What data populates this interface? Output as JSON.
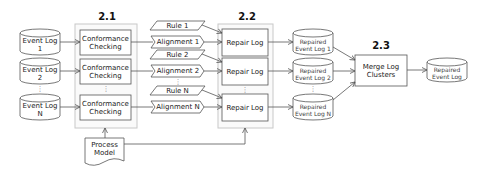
{
  "diagram": {
    "sections": {
      "conformance": "2.1",
      "repair": "2.2",
      "merge": "2.3"
    },
    "inputs": [
      {
        "label": "Event Log 1"
      },
      {
        "label": "Event Log 2"
      },
      {
        "label": "Event Log N"
      }
    ],
    "conformance_steps": [
      {
        "label": "Conformance\nChecking"
      },
      {
        "label": "Conformance\nChecking"
      },
      {
        "label": "Conformance\nChecking"
      }
    ],
    "rules": [
      {
        "label": "Rule 1"
      },
      {
        "label": "Rule 2"
      },
      {
        "label": "Rule N"
      }
    ],
    "alignments": [
      {
        "label": "Alignment 1"
      },
      {
        "label": "Alignment 2"
      },
      {
        "label": "Alignment N"
      }
    ],
    "repair_steps": [
      {
        "label": "Repair Log"
      },
      {
        "label": "Repair Log"
      },
      {
        "label": "Repair Log"
      }
    ],
    "repaired_logs": [
      {
        "label": "Repaired\nEvent Log 1"
      },
      {
        "label": "Repaired\nEvent Log 2"
      },
      {
        "label": "Repaired\nEvent Log N"
      }
    ],
    "process_model": {
      "label": "Process\nModel"
    },
    "merge_step": {
      "label": "Merge Log\nClusters"
    },
    "output": {
      "label": "Repaired\nEvent Log"
    },
    "ellipsis": "⋮",
    "colors": {
      "stroke": "#555555",
      "panel_border": "#c8c8c8",
      "panel_fill": "#fafafa",
      "box_fill": "#ffffff"
    }
  }
}
